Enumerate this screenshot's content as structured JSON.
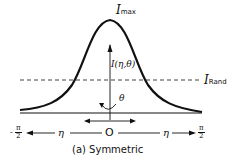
{
  "diagram": {
    "caption": "(a) Symmetric",
    "curve_type": "symmetric bell-shaped intensity distribution",
    "labels": {
      "peak_symbol": "I",
      "peak_subscript": "max",
      "intensity_function": "I(η,θ)",
      "random_level_symbol": "I",
      "random_level_subscript": "Rand",
      "angle_theta": "θ",
      "origin": "O",
      "eta_left": "η",
      "eta_right": "η",
      "left_limit_sign": "-",
      "left_limit_num": "π",
      "left_limit_den": "2",
      "right_limit_num": "π",
      "right_limit_den": "2"
    },
    "colors": {
      "line": "#111111",
      "background": "#ffffff"
    }
  }
}
